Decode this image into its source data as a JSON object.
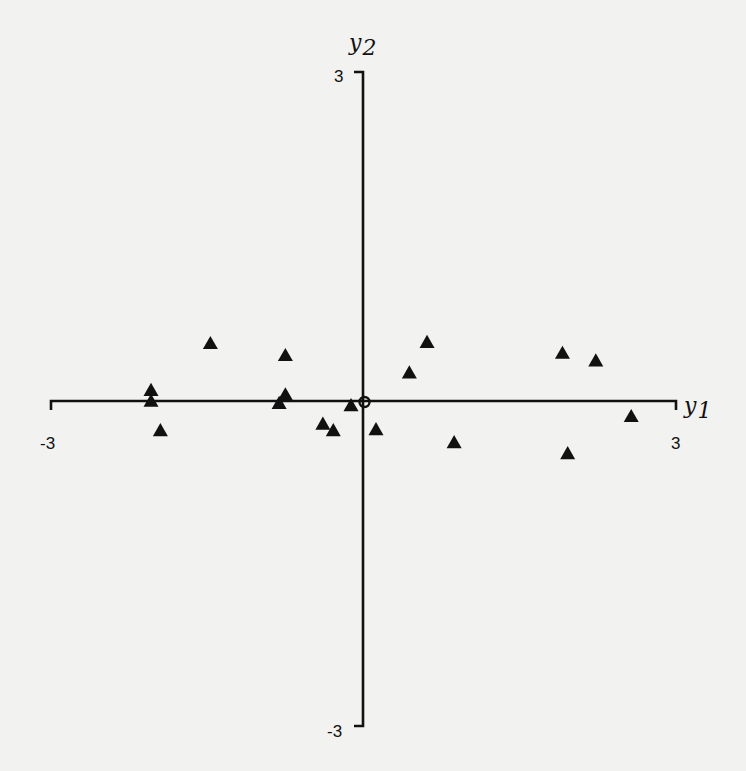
{
  "chart_data": {
    "type": "scatter",
    "title": "",
    "xlabel": "y1",
    "ylabel": "y2",
    "xlabel_parts": {
      "base": "y",
      "sub": "1"
    },
    "ylabel_parts": {
      "base": "y",
      "sub": "2"
    },
    "xlim": [
      -3,
      3
    ],
    "ylim": [
      -3,
      3
    ],
    "x_ticks": [
      "-3",
      "3"
    ],
    "y_ticks": [
      "3",
      "-3"
    ],
    "grid": false,
    "legend": null,
    "marker": "filled-triangle",
    "series": [
      {
        "name": "points",
        "points": [
          {
            "x": -2.04,
            "y": 0.08
          },
          {
            "x": -2.04,
            "y": -0.02
          },
          {
            "x": -1.95,
            "y": -0.29
          },
          {
            "x": -1.47,
            "y": 0.51
          },
          {
            "x": -0.75,
            "y": 0.4
          },
          {
            "x": -0.75,
            "y": 0.04
          },
          {
            "x": -0.81,
            "y": -0.04
          },
          {
            "x": -0.39,
            "y": -0.23
          },
          {
            "x": -0.29,
            "y": -0.29
          },
          {
            "x": -0.12,
            "y": -0.06
          },
          {
            "x": 0.12,
            "y": -0.28
          },
          {
            "x": 0.44,
            "y": 0.24
          },
          {
            "x": 0.61,
            "y": 0.52
          },
          {
            "x": 0.87,
            "y": -0.4
          },
          {
            "x": 1.91,
            "y": 0.42
          },
          {
            "x": 2.23,
            "y": 0.35
          },
          {
            "x": 2.57,
            "y": -0.16
          },
          {
            "x": 1.96,
            "y": -0.5
          }
        ]
      }
    ],
    "annotations": [
      {
        "type": "open-circle",
        "x": 0,
        "y": 0,
        "note": "origin marker"
      }
    ]
  },
  "layout": {
    "x_axis_px": {
      "y": 401,
      "x_min": 51,
      "x_max": 676
    },
    "y_axis_px": {
      "x": 363,
      "y_max": 72,
      "y_min": 726
    }
  }
}
